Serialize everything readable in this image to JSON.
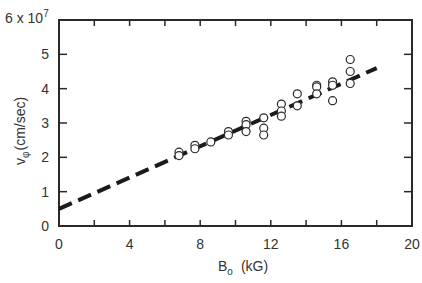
{
  "chart_data": {
    "type": "scatter",
    "title": "",
    "xlabel": "B",
    "xlabel_subscript": "o",
    "xlabel_units": "(kG)",
    "ylabel": "v",
    "ylabel_subscript": "φ",
    "ylabel_units": "(cm/sec)",
    "y_multiplier_label": "6 x 10",
    "y_multiplier_exponent": "7",
    "xlim": [
      0,
      20
    ],
    "ylim": [
      0,
      6
    ],
    "x_ticks": [
      0,
      4,
      8,
      12,
      16,
      20
    ],
    "x_minor_ticks": [
      2,
      6,
      10,
      14,
      18
    ],
    "y_ticks": [
      0,
      1,
      2,
      3,
      4,
      5
    ],
    "y_tick_labels": [
      "0",
      "1",
      "2",
      "3",
      "4",
      "5"
    ],
    "x_tick_labels": [
      "0",
      "4",
      "8",
      "12",
      "16",
      "20"
    ],
    "y_scale_note": "values in units of 10^7 cm/sec",
    "grid": false,
    "legend": null,
    "series": [
      {
        "name": "measured",
        "marker": "open-circle",
        "points": [
          [
            6.8,
            2.15
          ],
          [
            6.8,
            2.05
          ],
          [
            7.7,
            2.35
          ],
          [
            7.7,
            2.25
          ],
          [
            8.6,
            2.45
          ],
          [
            9.6,
            2.75
          ],
          [
            9.6,
            2.65
          ],
          [
            10.6,
            3.05
          ],
          [
            10.6,
            2.95
          ],
          [
            10.6,
            2.75
          ],
          [
            11.6,
            3.15
          ],
          [
            11.6,
            2.85
          ],
          [
            11.6,
            2.65
          ],
          [
            12.6,
            3.55
          ],
          [
            12.6,
            3.35
          ],
          [
            12.6,
            3.2
          ],
          [
            13.5,
            3.85
          ],
          [
            13.5,
            3.5
          ],
          [
            14.6,
            4.1
          ],
          [
            14.6,
            4.05
          ],
          [
            14.6,
            3.85
          ],
          [
            15.5,
            4.2
          ],
          [
            15.5,
            4.1
          ],
          [
            15.5,
            3.65
          ],
          [
            16.5,
            4.85
          ],
          [
            16.5,
            4.5
          ],
          [
            16.5,
            4.15
          ]
        ]
      },
      {
        "name": "linear fit",
        "style": "dashed",
        "points": [
          [
            0,
            0.5
          ],
          [
            18,
            4.6
          ]
        ]
      }
    ]
  }
}
